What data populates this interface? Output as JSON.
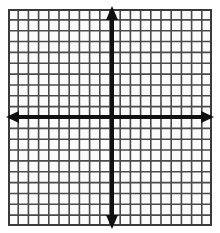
{
  "figure": {
    "kind": "cartesian-coordinate-grid",
    "background_color": "#ffffff",
    "cell_fill_color": "#fbfbfb"
  },
  "chart_data": {
    "type": "scatter",
    "title": "",
    "subtitle": "",
    "xlabel": "",
    "ylabel": "",
    "series": [
      {
        "name": "none",
        "x": [],
        "y": []
      }
    ],
    "x": [],
    "values": [],
    "categories": [],
    "xlim": [
      -10,
      10
    ],
    "ylim": [
      -10,
      10
    ],
    "x_tick_labels": [],
    "y_tick_labels": [],
    "grid": true,
    "grid_columns": 20,
    "grid_rows": 20,
    "grid_step": 1,
    "legend": false,
    "legend_position": "none",
    "annotations": [],
    "axes": {
      "x_axis_visible": true,
      "y_axis_visible": true,
      "origin_x": 0,
      "origin_y": 0,
      "arrowheads": [
        "left",
        "right",
        "up",
        "down"
      ]
    }
  },
  "geometry": {
    "plot_left": 8,
    "plot_top": 9,
    "plot_width": 204,
    "plot_height": 217,
    "cell_width": 10.2,
    "cell_height": 10.85,
    "origin_px_x": 112,
    "origin_px_y": 117,
    "columns": 20,
    "rows": 20
  },
  "style": {
    "grid_line_color": "#4a4a4a",
    "grid_line_width": 1.6,
    "border_color": "#3a3a3a",
    "border_width": 2,
    "axis_color": "#111111",
    "axis_line_width": 4,
    "arrow_half_width": 6,
    "arrow_length": 11
  },
  "labels": {
    "x_axis_name": "x-axis",
    "y_axis_name": "y-axis",
    "origin_name": "origin",
    "arrow_up": "positive y direction",
    "arrow_down": "negative y direction",
    "arrow_left": "negative x direction",
    "arrow_right": "positive x direction"
  }
}
